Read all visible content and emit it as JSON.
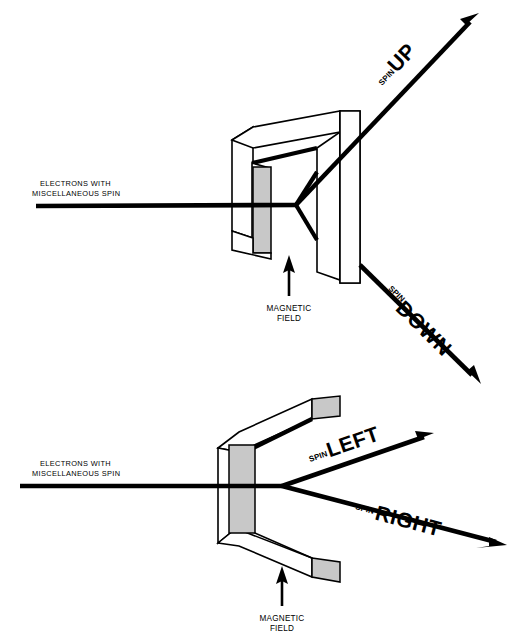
{
  "figure": {
    "background_color": "#ffffff",
    "ink_color": "#000000",
    "pole_face_color": "#c8c8c8"
  },
  "upper_panel": {
    "beam_label_line1": "ELECTRONS   WITH",
    "beam_label_line2": "MISCELLANEOUS   SPIN",
    "field_label_line1": "MAGNETIC",
    "field_label_line2": "FIELD",
    "output_up": {
      "prefix": "SPIN",
      "direction": "UP"
    },
    "output_down": {
      "prefix": "SPIN",
      "direction": "DOWN"
    }
  },
  "lower_panel": {
    "beam_label_line1": "ELECTRONS   WITH",
    "beam_label_line2": "MISCELLANEOUS   SPIN",
    "field_label_line1": "MAGNETIC",
    "field_label_line2": "FIELD",
    "output_left": {
      "prefix": "SPIN",
      "direction": "LEFT"
    },
    "output_right": {
      "prefix": "SPIN",
      "direction": "RIGHT"
    }
  }
}
